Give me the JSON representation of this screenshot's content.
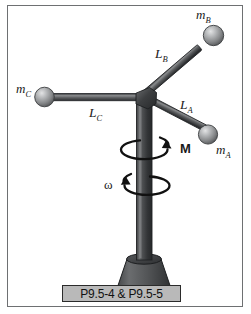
{
  "figure": {
    "caption": "P9.5-4 & P9.5-5",
    "alt_title": "Rotating vertical shaft with three masses on arms"
  },
  "labels": {
    "mass_a": {
      "symbol": "m",
      "subscript": "A"
    },
    "mass_b": {
      "symbol": "m",
      "subscript": "B"
    },
    "mass_c": {
      "symbol": "m",
      "subscript": "C"
    },
    "length_a": {
      "symbol": "L",
      "subscript": "A"
    },
    "length_b": {
      "symbol": "L",
      "subscript": "B"
    },
    "length_c": {
      "symbol": "L",
      "subscript": "C"
    },
    "moment": "M",
    "angular_velocity": "ω"
  },
  "colors": {
    "frame_border": "#6e7072",
    "background": "#ffffff",
    "pole_dark": "#2f3133",
    "pole_mid": "#4a4c4e",
    "pole_light": "#77797b",
    "arm_dark": "#3a3c3e",
    "arm_light": "#8c8e90",
    "sphere_light": "#d9dadb",
    "sphere_mid": "#9a9c9e",
    "sphere_dark": "#555759",
    "base_fill": "#57595b",
    "caption_fill": "#b9b9b9",
    "caption_border": "#2b2b2b",
    "ink": "#1a1a1a"
  }
}
